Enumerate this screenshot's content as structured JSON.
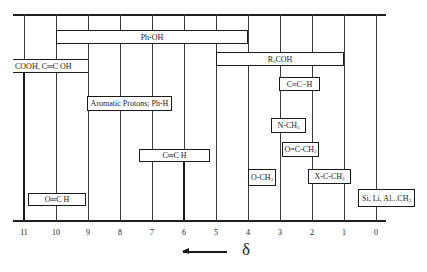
{
  "diagram": {
    "axis": {
      "symbol": "δ",
      "direction_arrow": "left",
      "ticks": [
        "11",
        "10",
        "9",
        "8",
        "7",
        "6",
        "5",
        "4",
        "3",
        "2",
        "1",
        "0"
      ]
    },
    "ranges": [
      {
        "label": "Ph-OH",
        "from_ppm": 10,
        "to_ppm": 4
      },
      {
        "label": "COOH,  C═C OH",
        "from_ppm": 11.3,
        "to_ppm": 9
      },
      {
        "label": "R₃COH",
        "from_ppm": 5,
        "to_ppm": 1
      },
      {
        "label": "C≡C−H",
        "from_ppm": 3,
        "to_ppm": 1.8
      },
      {
        "label": "Aromatic Protons; Ph-H",
        "from_ppm": 9,
        "to_ppm": 6.4
      },
      {
        "label": "N-CH₃",
        "from_ppm": 3.1,
        "to_ppm": 2.1
      },
      {
        "label": "C═C H",
        "from_ppm": 7.6,
        "to_ppm": 5.2
      },
      {
        "label": "O═C-CH₃",
        "from_ppm": 2.8,
        "to_ppm": 1.8
      },
      {
        "label": "O-CH₃",
        "from_ppm": 4,
        "to_ppm": 3.1
      },
      {
        "label": "X-C-CH₃",
        "from_ppm": 2.1,
        "to_ppm": 0.8
      },
      {
        "label": "O═C H",
        "from_ppm": 10.9,
        "to_ppm": 9
      },
      {
        "label": "Si, Li, Al...CH₃",
        "from_ppm": 0.5,
        "to_ppm": -1.2
      }
    ]
  }
}
